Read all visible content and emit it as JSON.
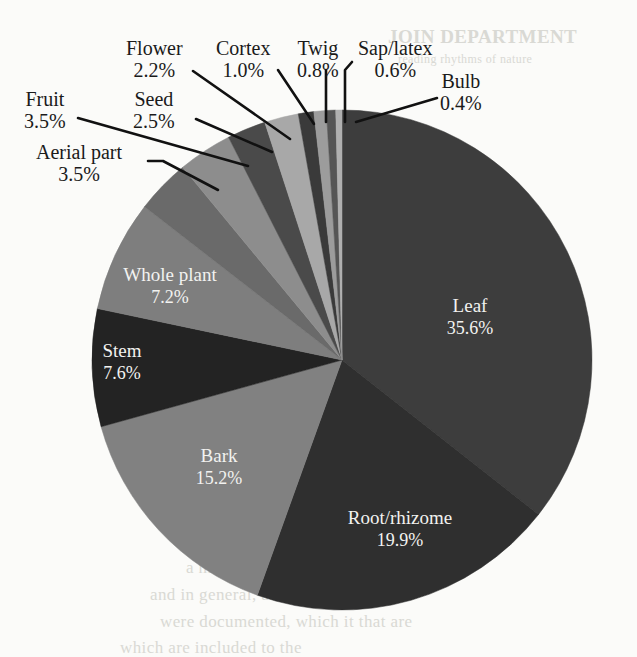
{
  "figure": {
    "background_color": "#fbfbf9",
    "type": "pie-chart-figure"
  },
  "chart_data": {
    "type": "pie",
    "title": "",
    "subtitle": "",
    "xlabel": "",
    "ylabel": "",
    "grid": false,
    "legend_position": "none",
    "label_format": "name + percent",
    "start_angle_deg": 0,
    "direction": "clockwise",
    "categories": [
      "Leaf",
      "Root/rhizome",
      "Bark",
      "Stem",
      "Whole plant",
      "Aerial part",
      "Fruit",
      "Seed",
      "Flower",
      "Cortex",
      "Twig",
      "Sap/latex",
      "Bulb"
    ],
    "values": [
      35.6,
      19.9,
      15.2,
      7.6,
      7.2,
      3.5,
      3.5,
      2.5,
      2.2,
      1.0,
      0.8,
      0.6,
      0.4
    ],
    "units": "%",
    "total": 100.0,
    "slices": [
      {
        "name": "Leaf",
        "percent_text": "35.6%",
        "value": 35.6,
        "color": "#3d3d3d",
        "label_placement": "inside"
      },
      {
        "name": "Root/rhizome",
        "percent_text": "19.9%",
        "value": 19.9,
        "color": "#2f2f2f",
        "label_placement": "inside"
      },
      {
        "name": "Bark",
        "percent_text": "15.2%",
        "value": 15.2,
        "color": "#818181",
        "label_placement": "inside"
      },
      {
        "name": "Stem",
        "percent_text": "7.6%",
        "value": 7.6,
        "color": "#232323",
        "label_placement": "inside"
      },
      {
        "name": "Whole plant",
        "percent_text": "7.2%",
        "value": 7.2,
        "color": "#7e7e7e",
        "label_placement": "inside"
      },
      {
        "name": "Aerial part",
        "percent_text": "3.5%",
        "value": 3.5,
        "color": "#6a6a6a",
        "label_placement": "callout"
      },
      {
        "name": "Fruit",
        "percent_text": "3.5%",
        "value": 3.5,
        "color": "#8d8d8d",
        "label_placement": "callout"
      },
      {
        "name": "Seed",
        "percent_text": "2.5%",
        "value": 2.5,
        "color": "#4a4a4a",
        "label_placement": "callout"
      },
      {
        "name": "Flower",
        "percent_text": "2.2%",
        "value": 2.2,
        "color": "#a8a8a8",
        "label_placement": "callout"
      },
      {
        "name": "Cortex",
        "percent_text": "1.0%",
        "value": 1.0,
        "color": "#3a3a3a",
        "label_placement": "callout"
      },
      {
        "name": "Twig",
        "percent_text": "0.8%",
        "value": 0.8,
        "color": "#9c9c9c",
        "label_placement": "callout"
      },
      {
        "name": "Sap/latex",
        "percent_text": "0.6%",
        "value": 0.6,
        "color": "#555555",
        "label_placement": "callout"
      },
      {
        "name": "Bulb",
        "percent_text": "0.4%",
        "value": 0.4,
        "color": "#b0b0b0",
        "label_placement": "callout"
      }
    ]
  },
  "inside_labels": [
    {
      "name": "Leaf",
      "percent": "35.6%",
      "x": 470,
      "y": 312
    },
    {
      "name": "Root/rhizome",
      "percent": "19.9%",
      "x": 400,
      "y": 524
    },
    {
      "name": "Bark",
      "percent": "15.2%",
      "x": 219,
      "y": 462
    },
    {
      "name": "Stem",
      "percent": "7.6%",
      "x": 122,
      "y": 357
    },
    {
      "name": "Whole plant",
      "percent": "7.2%",
      "x": 170,
      "y": 281
    }
  ],
  "callouts": [
    {
      "name": "Aerial part",
      "percent": "3.5%",
      "label_x": 36,
      "label_y": 141,
      "leader": "M 148 161 L 163 161 L 218 190"
    },
    {
      "name": "Fruit",
      "percent": "3.5%",
      "label_x": 24,
      "label_y": 88,
      "leader": "M 78 118 L 248 166"
    },
    {
      "name": "Seed",
      "percent": "2.5%",
      "label_x": 133,
      "label_y": 88,
      "leader": "M 196 119 L 272 152"
    },
    {
      "name": "Flower",
      "percent": "2.2%",
      "label_x": 126,
      "label_y": 37,
      "leader": "M 193 71 L 290 139"
    },
    {
      "name": "Cortex",
      "percent": "1.0%",
      "label_x": 216,
      "label_y": 37,
      "leader": "M 278 70 L 314 124"
    },
    {
      "name": "Twig",
      "percent": "0.8%",
      "label_x": 297,
      "label_y": 37,
      "leader": "M 326 70 L 326 122"
    },
    {
      "name": "Sap/latex",
      "percent": "0.6%",
      "label_x": 358,
      "label_y": 37,
      "leader": "M 352 62 L 345 70 L 345 122"
    },
    {
      "name": "Bulb",
      "percent": "0.4%",
      "label_x": 440,
      "label_y": 70,
      "leader": "M 437 98 L 356 122"
    }
  ],
  "bleed_through_text": {
    "top_heading": "JOIN DEPARTMENT",
    "top_line": "reading rhythms of nature",
    "bottom_1": "a multitude of ingredients",
    "bottom_2": "and in general, and one of certain",
    "bottom_3": "were documented, which it that are",
    "bottom_4": "which are included to the"
  },
  "geometry": {
    "center_x": 342,
    "center_y": 360,
    "radius": 250
  }
}
